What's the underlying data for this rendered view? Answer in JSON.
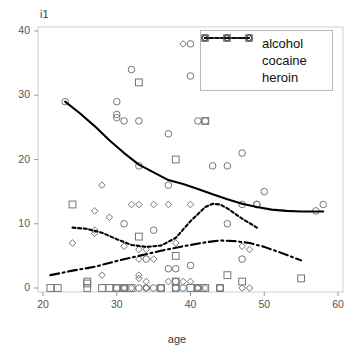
{
  "chart_data": {
    "type": "scatter",
    "title": "",
    "xlabel": "age",
    "ylabel": "i1",
    "xlim": [
      20,
      60
    ],
    "ylim": [
      0,
      40
    ],
    "xticks": [
      20,
      30,
      40,
      50,
      60
    ],
    "yticks": [
      0,
      10,
      20,
      30,
      40
    ],
    "grid": false,
    "legend_position": "top-right",
    "series": [
      {
        "name": "alcohol",
        "marker": "circle",
        "linestyle": "solid",
        "color": "#000000",
        "points": [
          [
            23,
            29
          ],
          [
            30,
            29
          ],
          [
            30,
            27
          ],
          [
            30,
            26.5
          ],
          [
            32,
            34
          ],
          [
            31,
            26
          ],
          [
            33,
            26
          ],
          [
            31,
            10
          ],
          [
            33,
            19
          ],
          [
            35,
            9
          ],
          [
            37,
            24
          ],
          [
            37,
            16
          ],
          [
            40,
            33
          ],
          [
            40,
            38
          ],
          [
            41,
            26
          ],
          [
            42,
            26
          ],
          [
            43,
            19
          ],
          [
            45,
            19
          ],
          [
            45,
            10
          ],
          [
            47,
            21
          ],
          [
            47,
            13
          ],
          [
            49,
            13
          ],
          [
            50,
            15
          ],
          [
            49,
            13
          ],
          [
            57,
            12
          ],
          [
            58,
            13
          ],
          [
            34,
            4.5
          ],
          [
            37,
            3
          ],
          [
            38,
            3
          ],
          [
            40,
            3.5
          ],
          [
            47,
            4.5
          ],
          [
            38,
            1
          ],
          [
            33,
            0
          ],
          [
            35,
            0
          ],
          [
            36,
            0
          ],
          [
            38,
            0
          ],
          [
            39,
            0
          ],
          [
            41,
            0
          ],
          [
            30,
            0
          ],
          [
            31,
            0
          ],
          [
            34,
            0
          ],
          [
            44,
            0
          ]
        ],
        "trend": [
          [
            23,
            29
          ],
          [
            25,
            27.2
          ],
          [
            27,
            25.2
          ],
          [
            29,
            23
          ],
          [
            31,
            21
          ],
          [
            33,
            19.2
          ],
          [
            35,
            18
          ],
          [
            37,
            16.8
          ],
          [
            39,
            16.2
          ],
          [
            41,
            15.4
          ],
          [
            43,
            14.6
          ],
          [
            45,
            13.8
          ],
          [
            47,
            13.1
          ],
          [
            49,
            12.6
          ],
          [
            51,
            12.2
          ],
          [
            53,
            12
          ],
          [
            55,
            11.9
          ],
          [
            58,
            11.9
          ]
        ]
      },
      {
        "name": "cocaine",
        "marker": "diamond",
        "linestyle": "dotted",
        "color": "#000000",
        "points": [
          [
            24,
            7
          ],
          [
            27,
            12
          ],
          [
            28,
            16
          ],
          [
            27,
            9
          ],
          [
            27,
            8.5
          ],
          [
            29,
            11
          ],
          [
            31,
            6.5
          ],
          [
            32,
            13
          ],
          [
            33,
            13
          ],
          [
            33,
            6
          ],
          [
            34,
            6
          ],
          [
            35,
            13
          ],
          [
            37,
            13
          ],
          [
            39,
            38
          ],
          [
            38,
            7
          ],
          [
            40,
            13
          ],
          [
            33,
            4.5
          ],
          [
            35,
            4.5
          ],
          [
            28,
            2
          ],
          [
            33,
            2
          ],
          [
            33,
            1.5
          ],
          [
            34,
            0
          ],
          [
            37,
            1
          ],
          [
            39,
            1
          ],
          [
            40,
            1
          ],
          [
            47,
            6.5
          ],
          [
            48,
            6
          ],
          [
            48,
            0
          ],
          [
            47,
            0
          ],
          [
            41,
            0
          ],
          [
            42,
            0
          ],
          [
            31,
            0
          ],
          [
            32,
            0
          ],
          [
            34,
            1
          ]
        ],
        "trend": [
          [
            24,
            9.4
          ],
          [
            26,
            9.2
          ],
          [
            28,
            8.6
          ],
          [
            30,
            7.6
          ],
          [
            32,
            6.7
          ],
          [
            34,
            6.4
          ],
          [
            36,
            6.6
          ],
          [
            38,
            7.8
          ],
          [
            40,
            10.4
          ],
          [
            42,
            12.6
          ],
          [
            43,
            13.1
          ],
          [
            44,
            13
          ],
          [
            45,
            12.4
          ],
          [
            46,
            11.6
          ],
          [
            47,
            10.8
          ],
          [
            48,
            10.1
          ],
          [
            49,
            9.4
          ]
        ]
      },
      {
        "name": "heroin",
        "marker": "square",
        "linestyle": "dashdot",
        "color": "#000000",
        "points": [
          [
            24,
            13
          ],
          [
            33,
            32
          ],
          [
            33,
            8
          ],
          [
            38,
            20
          ],
          [
            42,
            26
          ],
          [
            38,
            5
          ],
          [
            45,
            2
          ],
          [
            47,
            1
          ],
          [
            55,
            1.5
          ],
          [
            21,
            0
          ],
          [
            22,
            0
          ],
          [
            26,
            0
          ],
          [
            26,
            0.7
          ],
          [
            28,
            0
          ],
          [
            29,
            0
          ],
          [
            30,
            0
          ],
          [
            31,
            0
          ],
          [
            32,
            0
          ],
          [
            36,
            0
          ],
          [
            38,
            0
          ],
          [
            38,
            1
          ],
          [
            41,
            0
          ],
          [
            42,
            0
          ],
          [
            44,
            0
          ],
          [
            40,
            0
          ],
          [
            26,
            1
          ]
        ],
        "trend": [
          [
            21,
            2
          ],
          [
            24,
            2.7
          ],
          [
            27,
            3.3
          ],
          [
            30,
            4.2
          ],
          [
            33,
            5
          ],
          [
            36,
            5.8
          ],
          [
            39,
            6.5
          ],
          [
            42,
            7.1
          ],
          [
            44,
            7.4
          ],
          [
            46,
            7.3
          ],
          [
            48,
            7
          ],
          [
            50,
            6.4
          ],
          [
            52,
            5.6
          ],
          [
            55,
            4.3
          ]
        ]
      }
    ]
  },
  "legend": {
    "items": [
      {
        "label": "alcohol"
      },
      {
        "label": "cocaine"
      },
      {
        "label": "heroin"
      }
    ]
  }
}
